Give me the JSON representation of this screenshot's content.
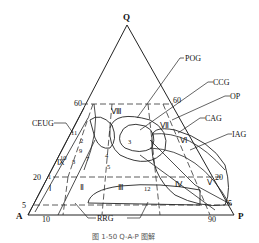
{
  "diagram": {
    "type": "QAP ternary classification diagram",
    "vertices": {
      "top": "Q",
      "left": "A",
      "right": "P"
    },
    "edge_ticks": {
      "left_edge": [
        "60",
        "20",
        "5"
      ],
      "right_edge": [
        "60",
        "20",
        "5"
      ],
      "bottom_edge": [
        "10",
        "90"
      ]
    },
    "fields_roman": [
      "Ⅰ",
      "Ⅱ",
      "Ⅲ",
      "Ⅳ",
      "Ⅴ",
      "Ⅵ",
      "Ⅶ",
      "Ⅷ",
      "Ⅸ"
    ],
    "rock_series_labels": {
      "pog": "POG",
      "ccg": "CCG",
      "op": "OP",
      "cag": "CAG",
      "iag": "IAG",
      "ceug": "CEUG",
      "rrg": "RRG"
    },
    "sample_points": [
      "1",
      "2",
      "3",
      "4",
      "5",
      "7",
      "8",
      "9",
      "10",
      "11",
      "12"
    ]
  },
  "caption": "图 1-50   Q-A-P 图解"
}
